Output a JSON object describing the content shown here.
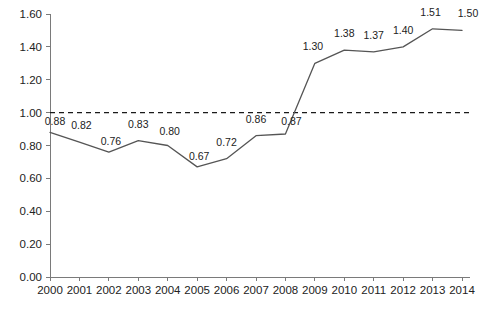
{
  "chart_data": {
    "type": "line",
    "title": "",
    "subtitle": "",
    "xlabel": "",
    "ylabel": "",
    "categories": [
      "2000",
      "2001",
      "2002",
      "2003",
      "2004",
      "2005",
      "2006",
      "2007",
      "2008",
      "2009",
      "2010",
      "2011",
      "2012",
      "2013",
      "2014"
    ],
    "values": [
      0.88,
      0.82,
      0.76,
      0.83,
      0.8,
      0.67,
      0.72,
      0.86,
      0.87,
      1.3,
      1.38,
      1.37,
      1.4,
      1.51,
      1.5
    ],
    "point_labels": [
      "0.88",
      "0.82",
      "0.76",
      "0.83",
      "0.80",
      "0.67",
      "0.72",
      "0.86",
      "0.87",
      "1.30",
      "1.38",
      "1.37",
      "1.40",
      "1.51",
      "1.50"
    ],
    "ylim": [
      0.0,
      1.6
    ],
    "ytick_values": [
      0.0,
      0.2,
      0.4,
      0.6,
      0.8,
      1.0,
      1.2,
      1.4,
      1.6
    ],
    "ytick_labels": [
      "0.00",
      "0.20",
      "0.40",
      "0.60",
      "0.80",
      "1.00",
      "1.20",
      "1.40",
      "1.60"
    ],
    "grid": false,
    "legend": "none",
    "reference_line": {
      "value": 1.0,
      "style": "dashed",
      "label": ""
    },
    "series": [
      {
        "name": "",
        "values": [
          0.88,
          0.82,
          0.76,
          0.83,
          0.8,
          0.67,
          0.72,
          0.86,
          0.87,
          1.3,
          1.38,
          1.37,
          1.4,
          1.51,
          1.5
        ]
      }
    ],
    "colors": {
      "line": "#555555",
      "reference_line": "#1a1a1a",
      "axis": "#7a7a7a",
      "text": "#222222",
      "background": "#ffffff"
    }
  }
}
